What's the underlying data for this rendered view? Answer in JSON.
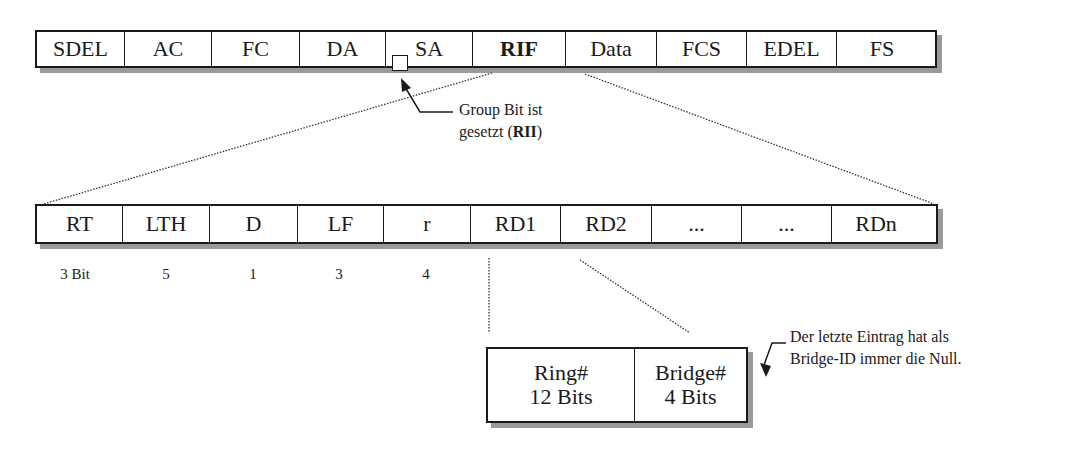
{
  "frame": {
    "fields": [
      {
        "label": "SDEL",
        "width": 88
      },
      {
        "label": "AC",
        "width": 87
      },
      {
        "label": "FC",
        "width": 88
      },
      {
        "label": "DA",
        "width": 86
      },
      {
        "label": "SA",
        "width": 87
      },
      {
        "label": "RIF",
        "width": 93,
        "bold": true
      },
      {
        "label": "Data",
        "width": 91
      },
      {
        "label": "FCS",
        "width": 90
      },
      {
        "label": "EDEL",
        "width": 90
      },
      {
        "label": "FS",
        "width": 90
      }
    ]
  },
  "group_bit_note": {
    "line1": "Group Bit ist",
    "line2_prefix": "gesetzt (",
    "line2_bold": "RII",
    "line2_suffix": ")"
  },
  "rif": {
    "fields": [
      {
        "label": "RT",
        "width": 86
      },
      {
        "label": "LTH",
        "width": 87
      },
      {
        "label": "D",
        "width": 88
      },
      {
        "label": "LF",
        "width": 86
      },
      {
        "label": "r",
        "width": 87
      },
      {
        "label": "RD1",
        "width": 90
      },
      {
        "label": "RD2",
        "width": 91
      },
      {
        "label": "...",
        "width": 90
      },
      {
        "label": "...",
        "width": 90
      },
      {
        "label": "RDn",
        "width": 88
      }
    ],
    "bit_sizes": [
      {
        "label": "3 Bit",
        "x": 40
      },
      {
        "label": "5",
        "x": 131
      },
      {
        "label": "1",
        "x": 218
      },
      {
        "label": "3",
        "x": 304
      },
      {
        "label": "4",
        "x": 391
      }
    ]
  },
  "route_descriptor": {
    "ring": {
      "name": "Ring#",
      "bits": "12 Bits"
    },
    "bridge": {
      "name": "Bridge#",
      "bits": "4 Bits"
    }
  },
  "last_entry_note": {
    "line1": "Der letzte Eintrag hat als",
    "line2": "Bridge-ID immer die Null."
  }
}
